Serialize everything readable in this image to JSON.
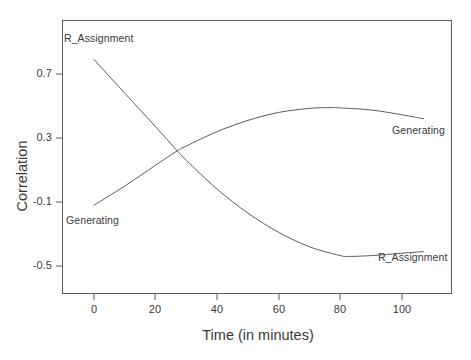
{
  "chart_data": {
    "type": "line",
    "title": "",
    "xlabel": "Time (in minutes)",
    "ylabel": "Correlation",
    "xlim": [
      -10,
      115
    ],
    "ylim": [
      -0.62,
      0.92
    ],
    "xticks": [
      "0",
      "20",
      "40",
      "60",
      "80",
      "100"
    ],
    "xtick_values": [
      0,
      20,
      40,
      60,
      80,
      100
    ],
    "yticks": [
      "0.7",
      "0.3",
      "-0.1",
      "-0.5"
    ],
    "ytick_values": [
      0.7,
      0.3,
      -0.1,
      -0.5
    ],
    "grid": false,
    "legend": "inline-annotations",
    "line_color": "#4a4a4a",
    "frame_color": "#5a5a5a",
    "series": [
      {
        "name": "R_Assignment",
        "x": [
          0,
          10,
          20,
          27,
          30,
          40,
          50,
          60,
          70,
          80,
          83,
          90,
          100,
          107
        ],
        "values": [
          0.79,
          0.58,
          0.37,
          0.22,
          0.16,
          -0.02,
          -0.17,
          -0.29,
          -0.38,
          -0.435,
          -0.44,
          -0.435,
          -0.42,
          -0.41
        ],
        "start_label": "R_Assignment",
        "end_label": "R_Assignment"
      },
      {
        "name": "Generating",
        "x": [
          0,
          10,
          20,
          27,
          30,
          40,
          50,
          60,
          70,
          77,
          80,
          90,
          100,
          107
        ],
        "values": [
          -0.12,
          0.0,
          0.13,
          0.22,
          0.25,
          0.34,
          0.41,
          0.46,
          0.485,
          0.49,
          0.488,
          0.475,
          0.445,
          0.42
        ],
        "start_label": "Generating",
        "end_label": "Generating"
      }
    ],
    "annotations": [
      {
        "text": "R_Assignment",
        "x": 0,
        "y": 0.85,
        "anchor": "start-top"
      },
      {
        "text": "Generating",
        "x": 0,
        "y": -0.2,
        "anchor": "start-bottom"
      },
      {
        "text": "Generating",
        "x": 100,
        "y": 0.34,
        "anchor": "end-bottom"
      },
      {
        "text": "R_Assignment",
        "x": 96,
        "y": -0.29,
        "anchor": "end-top"
      }
    ]
  }
}
